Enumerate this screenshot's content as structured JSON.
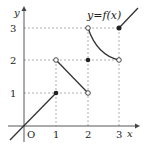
{
  "diagram": {
    "function_label": "y=f(x)",
    "axis_x_label": "x",
    "axis_y_label": "y",
    "origin_label": "O",
    "x_ticks": [
      "1",
      "2",
      "3"
    ],
    "y_ticks": [
      "1",
      "2",
      "3"
    ],
    "pieces": [
      {
        "type": "line",
        "from": [
          -0.45,
          -0.45
        ],
        "to": [
          1,
          1
        ],
        "end": "closed"
      },
      {
        "type": "line",
        "from": [
          1,
          2
        ],
        "to": [
          2,
          1
        ],
        "start": "open",
        "end": "open"
      },
      {
        "type": "curve",
        "from": [
          2,
          3
        ],
        "to": [
          3,
          2
        ],
        "start": "open",
        "end": "open"
      },
      {
        "type": "point",
        "at": [
          2,
          2
        ],
        "style": "closed"
      },
      {
        "type": "line",
        "from": [
          3,
          3
        ],
        "to": [
          3.6,
          3.7
        ],
        "start": "closed"
      }
    ],
    "colors": {
      "curve": "#333333",
      "guide": "#999999",
      "axis": "#444444"
    }
  }
}
